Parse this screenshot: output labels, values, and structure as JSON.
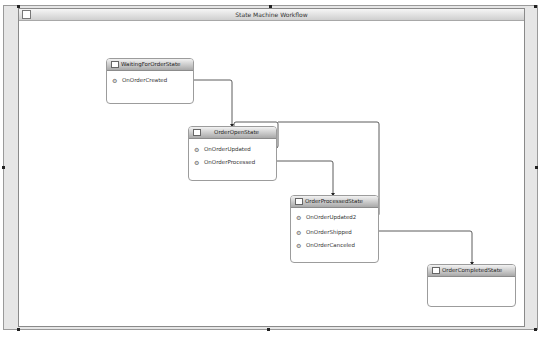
{
  "workflow": {
    "title": "State Machine Workflow",
    "title_icon": "state-machine-icon"
  },
  "states": [
    {
      "name": "WaitingForOrderState",
      "icon": "initial-state-icon",
      "events": [
        "OnOrderCreated"
      ]
    },
    {
      "name": "OrderOpenState",
      "icon": "state-icon",
      "events": [
        "OnOrderUpdated",
        "OnOrderProcessed"
      ]
    },
    {
      "name": "OrderProcessedState",
      "icon": "state-icon",
      "events": [
        "OnOrderUpdated2",
        "OnOrderShipped",
        "OnOrderCanceled"
      ]
    },
    {
      "name": "OrderCompletedState",
      "icon": "completed-state-icon",
      "events": []
    }
  ],
  "transitions": [
    {
      "from_event": "OnOrderCreated",
      "to": "OrderOpenState"
    },
    {
      "from_event": "OnOrderUpdated",
      "to": "OrderOpenState"
    },
    {
      "from_event": "OnOrderProcessed",
      "to": "OrderProcessedState"
    },
    {
      "from_event": "OnOrderUpdated2",
      "to": "OrderOpenState"
    },
    {
      "from_event": "OnOrderShipped",
      "to": "OrderCompletedState"
    }
  ],
  "colors": {
    "connector": "#333333",
    "header_top": "#f2f2f2",
    "header_bottom": "#a9a9a9",
    "frame": "#e6e6e6"
  }
}
